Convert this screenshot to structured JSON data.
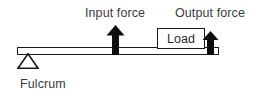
{
  "diagram": {
    "type": "lever-class-diagram",
    "background_color": "#ffffff",
    "line_color": "#1a1a1a",
    "text_color": "#3b3b3b",
    "labels": {
      "input_force": "Input force",
      "output_force": "Output force",
      "fulcrum": "Fulcrum",
      "load": "Load"
    },
    "elements": {
      "beam_name": "lever-beam",
      "fulcrum_name": "fulcrum-triangle",
      "input_arrow_name": "input-force-arrow",
      "output_arrow_name": "output-force-arrow",
      "load_name": "load-box"
    }
  }
}
